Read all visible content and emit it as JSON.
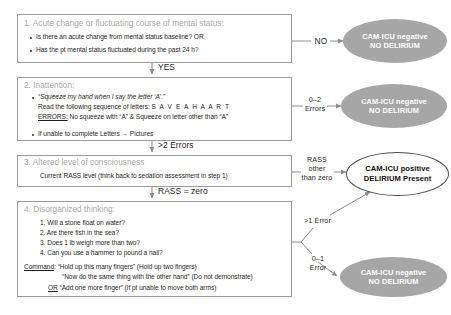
{
  "diagram": {
    "colors": {
      "box_border": "#9a9a9a",
      "box_title_text": "#a8a8a8",
      "negative_fill": "#a6a6a6",
      "negative_text": "#ffffff",
      "positive_fill": "#ffffff",
      "positive_border": "#4d4d4d",
      "positive_text": "#111111",
      "connector": "#8c8c8c",
      "body_text": "#1f1f1f"
    }
  },
  "steps": {
    "step1": {
      "title": "1. Acute change or fluctuating course of mental status:",
      "bullets": [
        "Is there an acute change from mental status baseline? OR",
        "Has the pt mental status fluctuated during the past 24 h?"
      ]
    },
    "step2": {
      "title": "2. Inattention:",
      "quote": "“Squeeze my hand when I say the letter ‘A’.”",
      "read_prefix": "Read the following sequence of letters:",
      "letters": "S A V E A H A A R T",
      "errors_label": "ERRORS:",
      "errors_text": "No squeeze with “A” & Squeeze on letter other than “A”",
      "fallback": "If unable to complete Letters → Pictures"
    },
    "step3": {
      "title": "3. Altered level of consciousness",
      "detail": "Current RASS level (think back to sedation assessment in step 1)"
    },
    "step4": {
      "title": "4. Disorganized thinking:",
      "questions": [
        "1. Will a stone float on water?",
        "2. Are there fish in the sea?",
        "3. Does 1 lb weigh more than two?",
        "4. Can you use a hammer to pound a nail?"
      ],
      "command_label": "Command",
      "command_lines": [
        ": “Hold up this many fingers” (Hold up two fingers)",
        "“Now do the same thing with the other hand” (Do not demonstrate)",
        "“Add one more finger” (If pt unable to move both arms)"
      ],
      "or_label": "OR"
    }
  },
  "edges": {
    "no": "NO",
    "yes": "YES",
    "errors_0_2_line1": "0–2",
    "errors_0_2_line2": "Errors",
    "errors_gt2": ">2 Errors",
    "rass_other_line1": "RASS",
    "rass_other_line2": "other",
    "rass_other_line3": "than zero",
    "rass_zero": "RASS = zero",
    "errors_gt1": ">1 Error",
    "errors_0_1_line1": "0–1",
    "errors_0_1_line2": "Error"
  },
  "outcomes": {
    "negative_top": {
      "line1": "CAM-ICU negative",
      "line2": "NO DELIRIUM"
    },
    "negative_mid": {
      "line1": "CAM-ICU negative",
      "line2": "NO DELIRIUM"
    },
    "negative_bottom": {
      "line1": "CAM-ICU negative",
      "line2": "NO DELIRIUM"
    },
    "positive": {
      "line1": "CAM-ICU positive",
      "line2": "DELIRIUM Present"
    }
  }
}
